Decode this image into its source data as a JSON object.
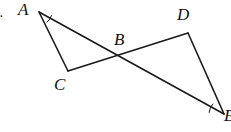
{
  "figure": {
    "kind": "geometry-diagram",
    "width": 231,
    "height": 132,
    "background_color": "#ffffff",
    "stroke_color": "#1a1a1a",
    "label_color": "#111111",
    "stroke_width": 1.6
  },
  "labels": [
    {
      "id": "A",
      "text": "A",
      "x": 18,
      "y": 1,
      "font_size": 17,
      "cut_off": false
    },
    {
      "id": "B",
      "text": "B",
      "x": 114,
      "y": 31,
      "font_size": 17,
      "cut_off": false
    },
    {
      "id": "C",
      "text": "C",
      "x": 54,
      "y": 76,
      "font_size": 17,
      "cut_off": false
    },
    {
      "id": "D",
      "text": "D",
      "x": 177,
      "y": 6,
      "font_size": 17,
      "cut_off": false
    },
    {
      "id": "E",
      "text": "E",
      "x": 224,
      "y": 107,
      "font_size": 17,
      "cut_off": true
    },
    {
      "id": "edge-mark",
      "text": ".",
      "x": 0,
      "y": 6,
      "font_size": 14,
      "cut_off": true
    }
  ],
  "points": {
    "A": {
      "x": 39,
      "y": 12
    },
    "B": {
      "x": 118,
      "y": 57
    },
    "C": {
      "x": 68,
      "y": 71
    },
    "D": {
      "x": 188,
      "y": 33
    },
    "E": {
      "x": 224,
      "y": 114
    }
  },
  "segments": [
    {
      "id": "AC",
      "from": "A",
      "to": "C",
      "name": "segment-a-c"
    },
    {
      "id": "AE",
      "from": "A",
      "to": "E",
      "name": "segment-a-e"
    },
    {
      "id": "CD",
      "from": "C",
      "to": "D",
      "name": "segment-c-d"
    },
    {
      "id": "DE",
      "from": "D",
      "to": "E",
      "name": "segment-d-e"
    }
  ],
  "angle_marks": [
    {
      "id": "angle-A",
      "vertex": "A",
      "radius": 13,
      "start_deg": 16,
      "end_deg": 51,
      "name": "angle-arc-a"
    },
    {
      "id": "angle-E",
      "vertex": "E",
      "radius": 15,
      "start_deg": 186,
      "end_deg": 222,
      "name": "angle-arc-e"
    }
  ]
}
